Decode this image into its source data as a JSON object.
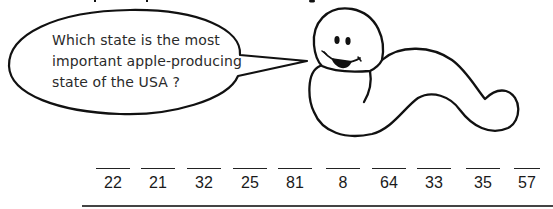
{
  "speech_bubble": {
    "lines": [
      "Which state is the most",
      "important apple-producing",
      "state of the USA ?"
    ]
  },
  "character": {
    "icon": "smiling-worm-icon"
  },
  "answer_blanks": {
    "numbers": [
      "22",
      "21",
      "32",
      "25",
      "81",
      "8",
      "64",
      "33",
      "35",
      "57"
    ],
    "centers_x": [
      113,
      158,
      204,
      250,
      295,
      343,
      389,
      434,
      483,
      527
    ]
  },
  "colors": {
    "ink": "#1a1a1a",
    "background": "#ffffff"
  }
}
